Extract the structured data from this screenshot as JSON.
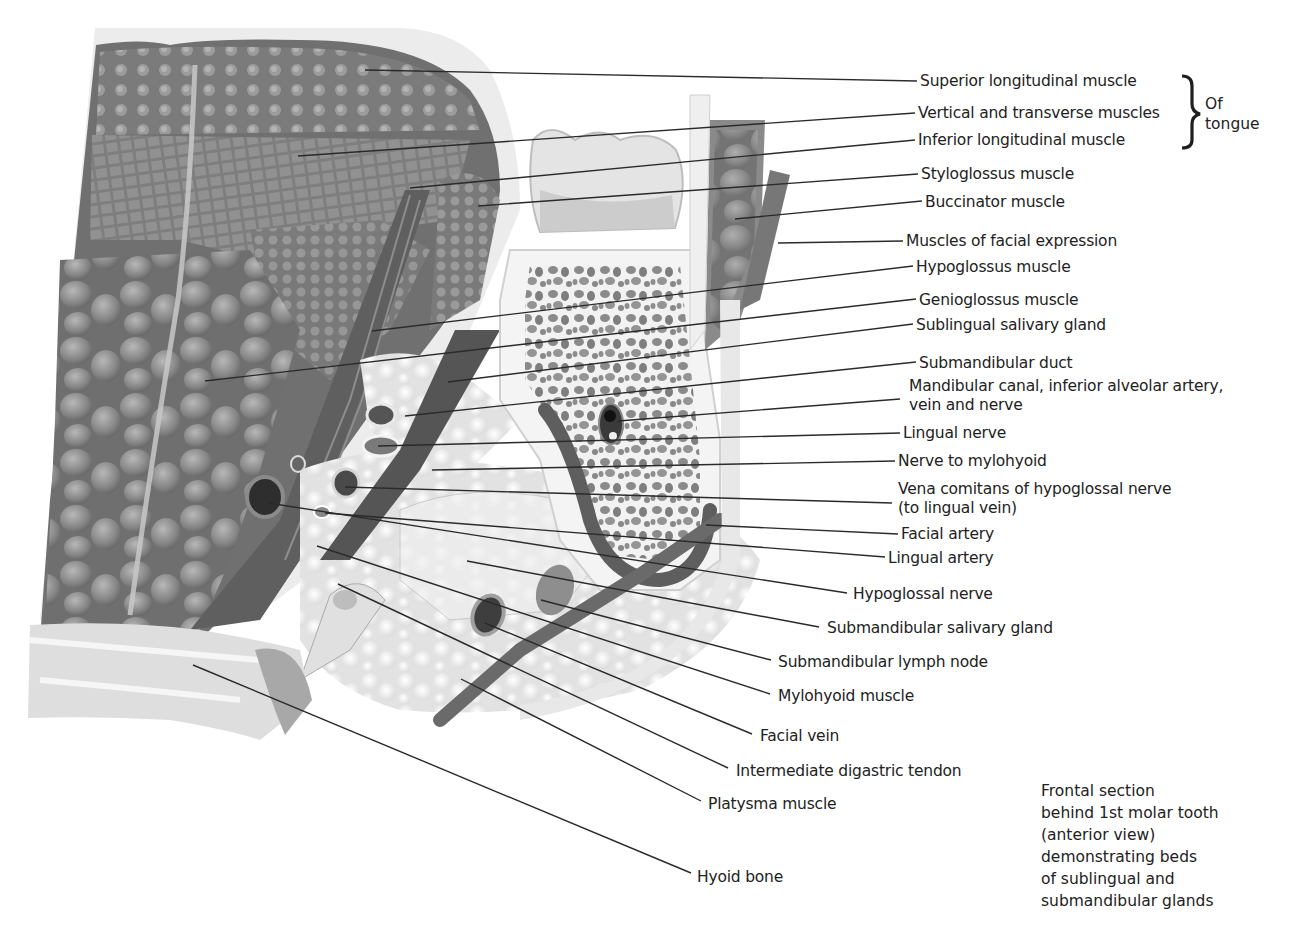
{
  "figure": {
    "colors": {
      "tissue_dark": "#6e6e6e",
      "tissue_mid": "#9a9a9a",
      "tissue_light": "#d6d6d6",
      "bone_light": "#efefef",
      "line": "#2a2a2a"
    }
  },
  "labels": [
    {
      "text": "Superior longitudinal muscle",
      "x": 920,
      "y": 72,
      "lx": 920,
      "ly": 81,
      "px": 365,
      "py": 70
    },
    {
      "text": "Vertical and transverse muscles",
      "x": 918,
      "y": 104,
      "lx": 918,
      "ly": 113,
      "px": 298,
      "py": 156
    },
    {
      "text": "Inferior longitudinal muscle",
      "x": 918,
      "y": 131,
      "lx": 918,
      "ly": 140,
      "px": 410,
      "py": 188
    },
    {
      "text": "Styloglossus muscle",
      "x": 921,
      "y": 165,
      "lx": 921,
      "ly": 174,
      "px": 478,
      "py": 206
    },
    {
      "text": "Buccinator muscle",
      "x": 925,
      "y": 193,
      "lx": 925,
      "ly": 201,
      "px": 735,
      "py": 219
    },
    {
      "text": "Muscles of facial expression",
      "x": 906,
      "y": 232,
      "lx": 906,
      "ly": 241,
      "px": 778,
      "py": 243
    },
    {
      "text": "Hypoglossus muscle",
      "x": 916,
      "y": 258,
      "lx": 916,
      "ly": 266,
      "px": 372,
      "py": 331
    },
    {
      "text": "Genioglossus muscle",
      "x": 919,
      "y": 291,
      "lx": 919,
      "ly": 299,
      "px": 205,
      "py": 381
    },
    {
      "text": "Sublingual salivary gland",
      "x": 916,
      "y": 316,
      "lx": 916,
      "ly": 324,
      "px": 448,
      "py": 382
    },
    {
      "text": "Submandibular duct",
      "x": 919,
      "y": 354,
      "lx": 919,
      "ly": 362,
      "px": 405,
      "py": 416
    },
    {
      "text": "Mandibular canal, inferior alveolar artery,",
      "text2": "vein and nerve",
      "x": 909,
      "y": 377,
      "lx": 903,
      "ly": 399,
      "px": 618,
      "py": 421
    },
    {
      "text": "Lingual nerve",
      "x": 903,
      "y": 424,
      "lx": 903,
      "ly": 433,
      "px": 378,
      "py": 446
    },
    {
      "text": "Nerve to mylohyoid",
      "x": 898,
      "y": 452,
      "lx": 898,
      "ly": 461,
      "px": 432,
      "py": 470
    },
    {
      "text": "Vena comitans of hypoglossal nerve",
      "text2": "(to lingual vein)",
      "x": 898,
      "y": 480,
      "lx": 895,
      "ly": 503,
      "px": 345,
      "py": 487
    },
    {
      "text": "Facial artery",
      "x": 901,
      "y": 525,
      "lx": 901,
      "ly": 534,
      "px": 706,
      "py": 525
    },
    {
      "text": "Lingual artery",
      "x": 888,
      "y": 549,
      "lx": 888,
      "ly": 557,
      "px": 325,
      "py": 513
    },
    {
      "text": "Hypoglossal nerve",
      "x": 853,
      "y": 585,
      "lx": 850,
      "ly": 593,
      "px": 268,
      "py": 503
    },
    {
      "text": "Submandibular salivary gland",
      "x": 827,
      "y": 619,
      "lx": 822,
      "ly": 627,
      "px": 467,
      "py": 561
    },
    {
      "text": "Submandibular lymph node",
      "x": 778,
      "y": 653,
      "lx": 774,
      "ly": 660,
      "px": 541,
      "py": 600
    },
    {
      "text": "Mylohyoid muscle",
      "x": 778,
      "y": 687,
      "lx": 773,
      "ly": 694,
      "px": 317,
      "py": 546
    },
    {
      "text": "Facial vein",
      "x": 760,
      "y": 727,
      "lx": 755,
      "ly": 734,
      "px": 485,
      "py": 623
    },
    {
      "text": "Intermediate digastric tendon",
      "x": 736,
      "y": 762,
      "lx": 731,
      "ly": 768,
      "px": 338,
      "py": 584
    },
    {
      "text": "Platysma muscle",
      "x": 708,
      "y": 795,
      "lx": 704,
      "ly": 801,
      "px": 461,
      "py": 679
    },
    {
      "text": "Hyoid bone",
      "x": 697,
      "y": 868,
      "lx": 694,
      "ly": 873,
      "px": 193,
      "py": 665
    }
  ],
  "brace": {
    "text_line1": "Of",
    "text_line2": "tongue"
  },
  "caption": [
    "Frontal section",
    "behind 1st molar tooth",
    "(anterior view)",
    "demonstrating beds",
    "of sublingual and",
    "submandibular glands"
  ]
}
